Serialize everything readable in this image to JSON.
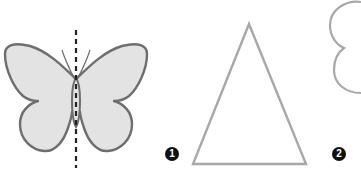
{
  "figure": {
    "example": {
      "shape": "butterfly",
      "symmetry_line": "vertical dashed"
    },
    "items": [
      {
        "number": "1",
        "shape": "isosceles triangle"
      },
      {
        "number": "2",
        "shape": "cloud / rounded lobed shape (partially visible)"
      }
    ]
  },
  "colors": {
    "outline": "#6e6e6e",
    "wing_fill": "#e3e3e3",
    "shape_outline": "#a8a8a8",
    "badge_bg": "#111111",
    "badge_text": "#ffffff",
    "axis": "#222222"
  }
}
